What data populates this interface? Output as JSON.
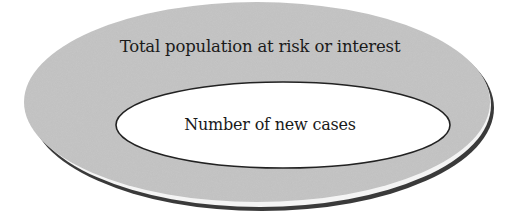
{
  "diagram": {
    "type": "nested-ellipses",
    "outer": {
      "label": "Total population at risk or interest",
      "fill": "#c8c8c8",
      "shadow": "#3a3a3a"
    },
    "inner": {
      "label": "Number of new cases",
      "fill": "#ffffff",
      "stroke": "#222222"
    }
  }
}
